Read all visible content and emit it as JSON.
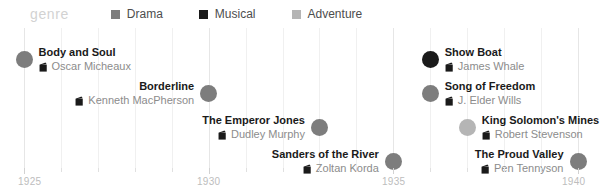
{
  "legend": {
    "title": "genre",
    "items": [
      {
        "label": "Drama",
        "color": "#7d7d7d",
        "icon": "square-swatch-icon"
      },
      {
        "label": "Musical",
        "color": "#1a1a1a",
        "icon": "square-swatch-icon"
      },
      {
        "label": "Adventure",
        "color": "#b5b5b5",
        "icon": "square-swatch-icon"
      }
    ]
  },
  "chart_data": {
    "type": "scatter",
    "title": "genre",
    "xlabel": "",
    "ylabel": "",
    "xlim": [
      1925,
      1940
    ],
    "grid": true,
    "legend_position": "top",
    "tick_labels": [
      "1925",
      "1930",
      "1935",
      "1940"
    ],
    "tick_values": [
      1925,
      1930,
      1935,
      1940
    ],
    "minor_tick_interval": 1,
    "series": [
      {
        "name": "Drama",
        "color": "#7d7d7d"
      },
      {
        "name": "Musical",
        "color": "#1a1a1a"
      },
      {
        "name": "Adventure",
        "color": "#b5b5b5"
      }
    ],
    "points": [
      {
        "title": "Body and Soul",
        "director": "Oscar Micheaux",
        "year": 1925,
        "genre": "Drama",
        "color": "#7d7d7d",
        "align": "left",
        "row": 0
      },
      {
        "title": "Borderline",
        "director": "Kenneth MacPherson",
        "year": 1930,
        "genre": "Drama",
        "color": "#7d7d7d",
        "align": "right",
        "row": 1
      },
      {
        "title": "The Emperor Jones",
        "director": "Dudley Murphy",
        "year": 1933,
        "genre": "Drama",
        "color": "#7d7d7d",
        "align": "right",
        "row": 2
      },
      {
        "title": "Sanders of the River",
        "director": "Zoltan Korda",
        "year": 1935,
        "genre": "Drama",
        "color": "#7d7d7d",
        "align": "right",
        "row": 3
      },
      {
        "title": "Show Boat",
        "director": "James Whale",
        "year": 1936,
        "genre": "Musical",
        "color": "#1a1a1a",
        "align": "left",
        "row": 0
      },
      {
        "title": "Song of Freedom",
        "director": "J. Elder Wills",
        "year": 1936,
        "genre": "Drama",
        "color": "#7d7d7d",
        "align": "left",
        "row": 1
      },
      {
        "title": "King Solomon's Mines",
        "director": "Robert Stevenson",
        "year": 1937,
        "genre": "Adventure",
        "color": "#b5b5b5",
        "align": "left",
        "row": 2
      },
      {
        "title": "The Proud Valley",
        "director": "Pen Tennyson",
        "year": 1940,
        "genre": "Drama",
        "color": "#7d7d7d",
        "align": "right",
        "row": 3
      }
    ]
  },
  "axis": {
    "ticks": [
      {
        "label": "1925",
        "value": 1925,
        "major": true
      },
      {
        "label": "",
        "value": 1926,
        "major": false
      },
      {
        "label": "",
        "value": 1927,
        "major": false
      },
      {
        "label": "",
        "value": 1928,
        "major": false
      },
      {
        "label": "",
        "value": 1929,
        "major": false
      },
      {
        "label": "1930",
        "value": 1930,
        "major": true
      },
      {
        "label": "",
        "value": 1931,
        "major": false
      },
      {
        "label": "",
        "value": 1932,
        "major": false
      },
      {
        "label": "",
        "value": 1933,
        "major": false
      },
      {
        "label": "",
        "value": 1934,
        "major": false
      },
      {
        "label": "1935",
        "value": 1935,
        "major": true
      },
      {
        "label": "",
        "value": 1936,
        "major": false
      },
      {
        "label": "",
        "value": 1937,
        "major": false
      },
      {
        "label": "",
        "value": 1938,
        "major": false
      },
      {
        "label": "",
        "value": 1939,
        "major": false
      },
      {
        "label": "1940",
        "value": 1940,
        "major": true
      }
    ]
  }
}
